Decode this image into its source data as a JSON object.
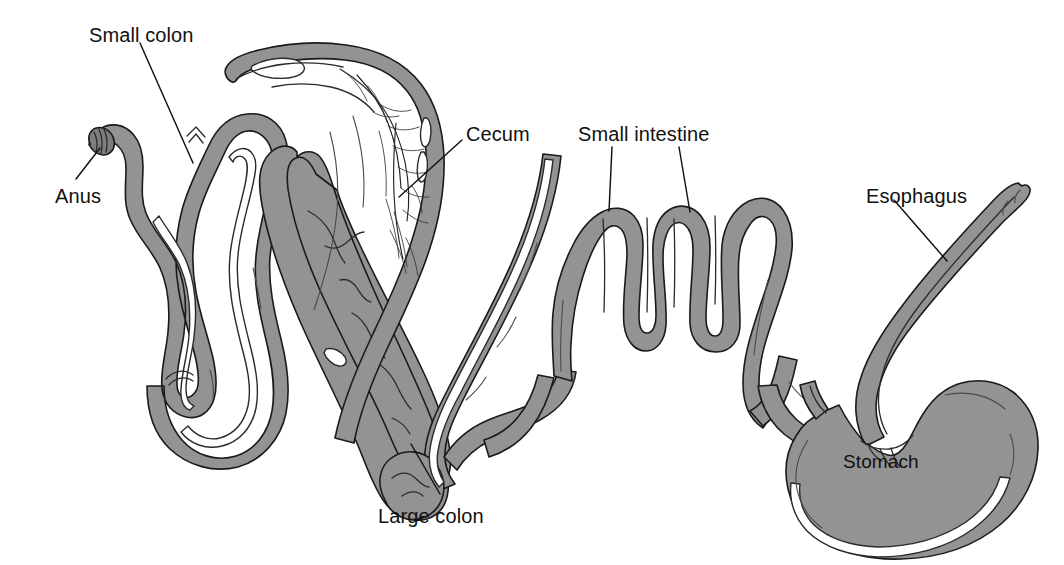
{
  "figure": {
    "background_color": "#ffffff",
    "organ_fill_color": "#939393",
    "organ_outline_color": "#1a1a1a",
    "lumen_color": "#ffffff",
    "label_text_color": "#111111",
    "width": 1064,
    "height": 565
  },
  "labels": {
    "small_colon": "Small colon",
    "anus": "Anus",
    "cecum": "Cecum",
    "small_intestine": "Small intestine",
    "esophagus": "Esophagus",
    "stomach": "Stomach",
    "large_colon": "Large colon"
  },
  "parts": [
    {
      "id": "anus",
      "name": "Anus",
      "label_x": 55,
      "label_y": 186,
      "has_leader": true,
      "leader_count": 1
    },
    {
      "id": "small-colon",
      "name": "Small colon",
      "label_x": 89,
      "label_y": 25,
      "has_leader": true,
      "leader_count": 1
    },
    {
      "id": "cecum",
      "name": "Cecum",
      "label_x": 466,
      "label_y": 124,
      "has_leader": true,
      "leader_count": 1
    },
    {
      "id": "small-intestine",
      "name": "Small intestine",
      "label_x": 578,
      "label_y": 124,
      "has_leader": true,
      "leader_count": 2
    },
    {
      "id": "esophagus",
      "name": "Esophagus",
      "label_x": 866,
      "label_y": 186,
      "has_leader": true,
      "leader_count": 1
    },
    {
      "id": "stomach",
      "name": "Stomach",
      "label_x": 843,
      "label_y": 452,
      "has_leader": false,
      "leader_count": 0
    },
    {
      "id": "large-colon",
      "name": "Large colon",
      "label_x": 378,
      "label_y": 506,
      "has_leader": true,
      "leader_count": 1
    }
  ]
}
